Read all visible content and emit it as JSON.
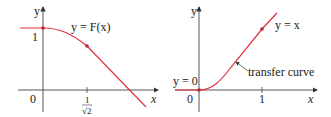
{
  "left_graph": {
    "curve_label": "y = F(x)",
    "y_axis_label": "y",
    "x_axis_label": "x",
    "origin_label": "0",
    "y_tick_label": "1",
    "x_tick_numerator": "1",
    "x_tick_denominator": "√2",
    "curve_color": "#e0303a"
  },
  "right_graph": {
    "curve_label": "y = x",
    "y_axis_label": "y",
    "x_axis_label": "x",
    "origin_label": "0",
    "y0_label": "y = 0",
    "x_tick_label": "1",
    "annotation": "transfer curve",
    "curve_color": "#e0303a"
  }
}
